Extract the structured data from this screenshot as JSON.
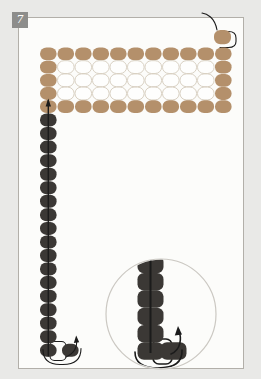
{
  "badge": {
    "label": "7"
  },
  "diagram": {
    "colors": {
      "page_bg": "#e9e9e7",
      "panel_bg": "#fcfcfa",
      "panel_border": "#b2afa9",
      "badge_bg": "#8d8d8b",
      "badge_text": "#ffffff",
      "accent_bead": "#b4906b",
      "white_bead_fill": "#fefefd",
      "white_bead_outline": "#d9d1c3",
      "dark_bead": "#3b3835",
      "thread": "#1b1b1b",
      "magnifier_border": "#cbc8c2"
    },
    "band": {
      "rows": 5,
      "columns": 11
    },
    "start_bead_count": 1,
    "column_bead_count": 18,
    "side_bead_count": 1,
    "magnifier": {
      "column_bead_count": 6,
      "side_bead_count": 1
    }
  }
}
